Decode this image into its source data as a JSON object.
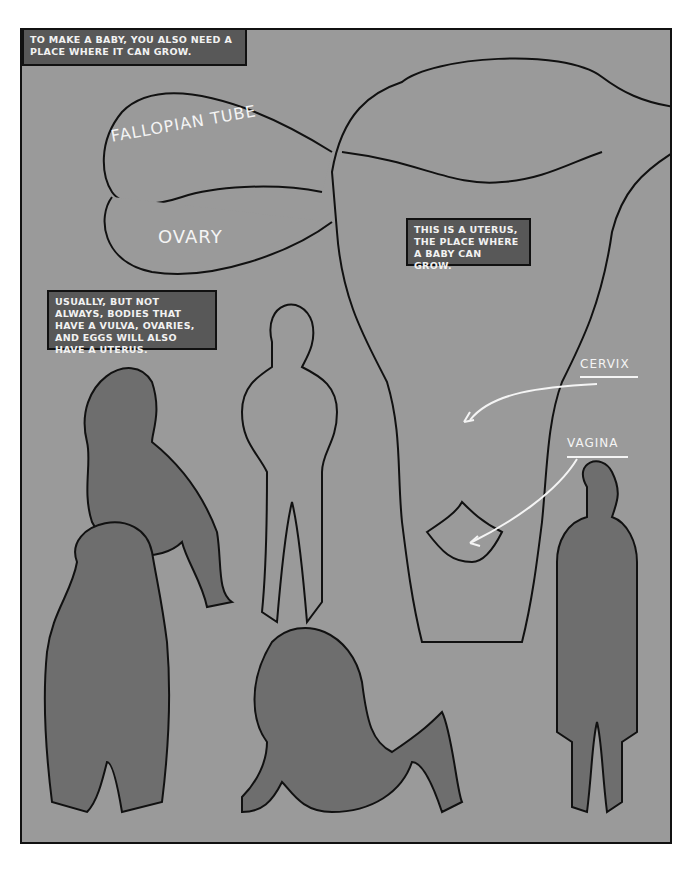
{
  "captions": {
    "intro": "TO MAKE A BABY, YOU ALSO NEED A PLACE WHERE IT CAN GROW.",
    "uterus": "THIS IS A UTERUS, THE PLACE WHERE A BABY CAN GROW.",
    "bodies": "USUALLY, BUT NOT ALWAYS, BODIES THAT HAVE A VULVA, OVARIES, AND EGGS WILL ALSO HAVE A UTERUS."
  },
  "labels": {
    "fallopian_tube": "FALLOPIAN TUBE",
    "ovary": "OVARY",
    "cervix": "CERVIX",
    "vagina": "VAGINA"
  },
  "colors": {
    "background": "#9a9a9a",
    "caption_box": "#585858",
    "figure_dark": "#6e6e6e",
    "outline": "#111111",
    "label_text": "#f4f4f4"
  }
}
